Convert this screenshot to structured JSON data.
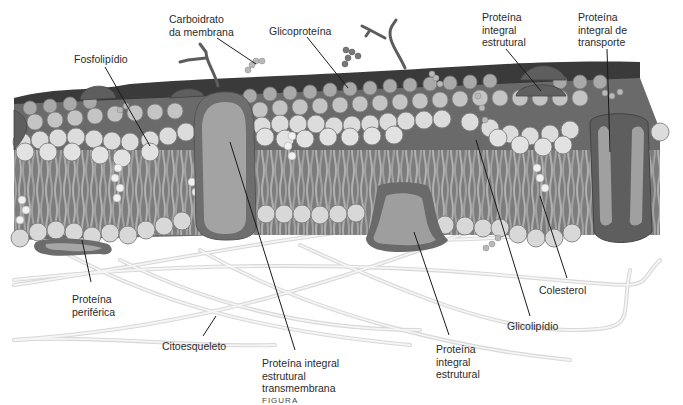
{
  "figure": {
    "caption": "FIGURA",
    "labels": {
      "carboidrato": [
        "Carboidrato",
        "da membrana"
      ],
      "glicoproteina": [
        "Glicoproteína"
      ],
      "fosfolipidio": [
        "Fosfolipídio"
      ],
      "proteina_integral_estrutural_top": [
        "Proteína",
        "integral",
        "estrutural"
      ],
      "proteina_integral_transporte": [
        "Proteína",
        "integral de",
        "transporte"
      ],
      "proteina_periferica": [
        "Proteína",
        "periférica"
      ],
      "citoesqueleto": [
        "Citoesqueleto"
      ],
      "proteina_transmembrana": [
        "Proteína integral",
        "estrutural",
        "transmembrana"
      ],
      "proteina_integral_estrutural_bottom": [
        "Proteína",
        "integral",
        "estrutural"
      ],
      "colesterol": [
        "Colesterol"
      ],
      "glicolipidio": [
        "Glicolipídio"
      ]
    },
    "colors": {
      "head_light": "#dcdcdc",
      "head_mid": "#b9b9b9",
      "head_dark": "#5a5a5a",
      "protein_outer": "#6e6e6e",
      "protein_inner": "#a3a3a3",
      "tail": "#9a9a9a",
      "core": "#7b7b7b",
      "fiber": "#e6e6e6",
      "leader": "#1a1a1a"
    }
  }
}
